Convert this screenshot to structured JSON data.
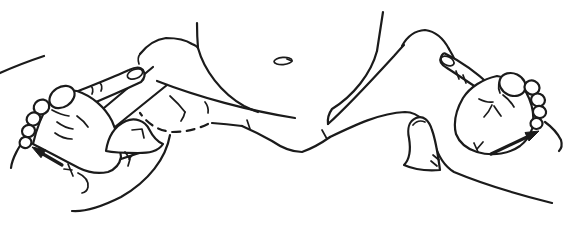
{
  "figure": {
    "kind": "medical-line-illustration",
    "description": "Black-and-white line drawing of an infant lying on its back with both hips and knees flexed. An examiner's hands grasp each leg with the fingers along the outer thighs and the thumbs against the inner thighs, spreading the legs outward. A small solid arrow beside the left heel points up-left and one beside the right heel points up-right, showing the direction of movement; a dashed arc marks the hidden left hip joint, and the navel is visible at the top of the abdomen."
  },
  "colors": {
    "line": "#1b1b1b",
    "background": "#ffffff"
  },
  "arrows": {
    "left": "up-left",
    "right": "up-right"
  },
  "hip_outline_style": "dashed"
}
